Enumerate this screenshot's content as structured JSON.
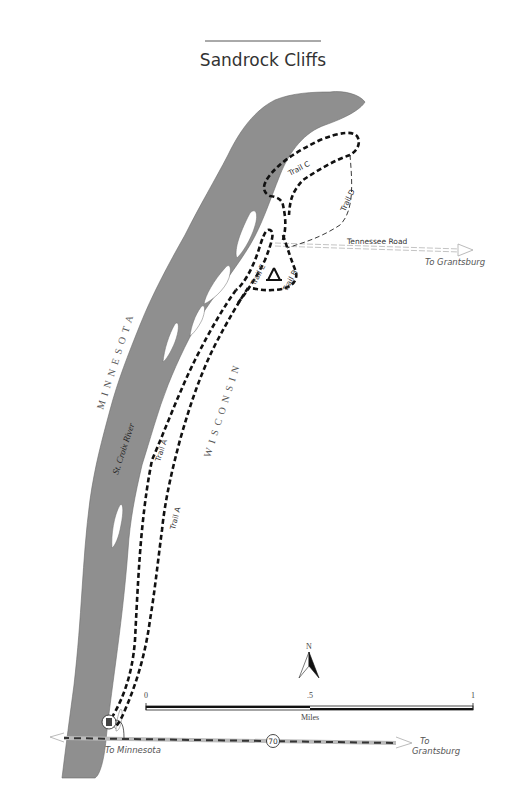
{
  "map": {
    "title": "Sandrock Cliffs",
    "states": {
      "west": "MINNESOTA",
      "east": "WISCONSIN"
    },
    "river": "St. Croix River",
    "trails": [
      {
        "id": "A",
        "label": "Trail A"
      },
      {
        "id": "A2",
        "label": "Trail A"
      },
      {
        "id": "B",
        "label": "Trail B"
      },
      {
        "id": "C",
        "label": "Trail C"
      },
      {
        "id": "D",
        "label": "Trail D"
      },
      {
        "id": "E",
        "label": "Trail E"
      }
    ],
    "roads": {
      "tennessee": {
        "label": "Tennessee Road",
        "destination": "To Grantsburg"
      },
      "highway": {
        "number": "70",
        "west_destination": "To Minnesota",
        "east_destination_line1": "To",
        "east_destination_line2": "Grantsburg"
      }
    },
    "north_arrow": {
      "label": "N"
    },
    "scale_bar": {
      "ticks": [
        "0",
        ".5",
        "1"
      ],
      "unit": "Miles"
    },
    "symbols": [
      "campsite-icon",
      "parking-icon"
    ],
    "colors": {
      "water": "#8f8f8f",
      "trail": "#111111",
      "road": "#bbbbbb",
      "background": "#ffffff"
    }
  }
}
